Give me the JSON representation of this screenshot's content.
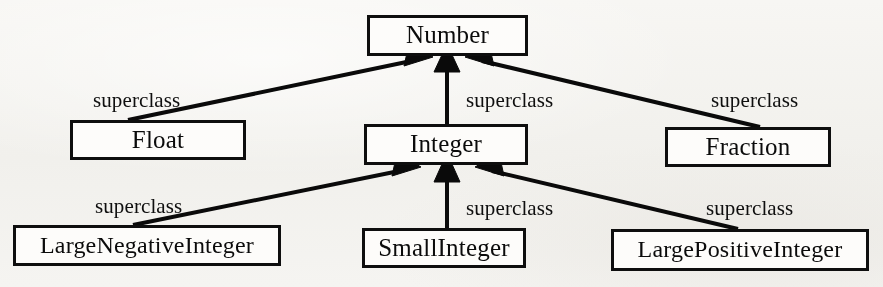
{
  "diagram": {
    "type": "class-hierarchy",
    "background_color": "#f2f1ee",
    "line_color": "#0c0c0c",
    "box_fill_color": "#fbfaf8",
    "nodes": [
      {
        "id": "number",
        "label": "Number",
        "x": 367,
        "y": 15,
        "w": 161,
        "h": 41
      },
      {
        "id": "float",
        "label": "Float",
        "x": 70,
        "y": 120,
        "w": 176,
        "h": 40
      },
      {
        "id": "integer",
        "label": "Integer",
        "x": 364,
        "y": 124,
        "w": 164,
        "h": 41
      },
      {
        "id": "fraction",
        "label": "Fraction",
        "x": 665,
        "y": 127,
        "w": 166,
        "h": 40
      },
      {
        "id": "large-negative-integer",
        "label": "LargeNegativeInteger",
        "x": 13,
        "y": 225,
        "w": 268,
        "h": 41
      },
      {
        "id": "small-integer",
        "label": "SmallInteger",
        "x": 362,
        "y": 228,
        "w": 164,
        "h": 40
      },
      {
        "id": "large-positive-integer",
        "label": "LargePositiveInteger",
        "x": 611,
        "y": 229,
        "w": 258,
        "h": 42
      }
    ],
    "edges": [
      {
        "id": "float-to-number",
        "from": "float",
        "to": "number",
        "label": "superclass",
        "label_x": 93,
        "label_y": 88
      },
      {
        "id": "integer-to-number",
        "from": "integer",
        "to": "number",
        "label": "superclass",
        "label_x": 466,
        "label_y": 88
      },
      {
        "id": "fraction-to-number",
        "from": "fraction",
        "to": "number",
        "label": "superclass",
        "label_x": 711,
        "label_y": 88
      },
      {
        "id": "lni-to-integer",
        "from": "large-negative-integer",
        "to": "integer",
        "label": "superclass",
        "label_x": 95,
        "label_y": 194
      },
      {
        "id": "si-to-integer",
        "from": "small-integer",
        "to": "integer",
        "label": "superclass",
        "label_x": 466,
        "label_y": 196
      },
      {
        "id": "lpi-to-integer",
        "from": "large-positive-integer",
        "to": "integer",
        "label": "superclass",
        "label_x": 706,
        "label_y": 196
      }
    ]
  }
}
